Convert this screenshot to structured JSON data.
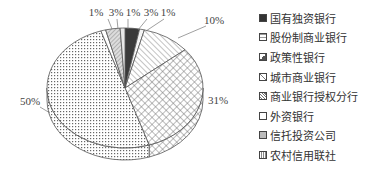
{
  "chart_data": {
    "type": "pie",
    "style": "3d-pie with hatch patterns",
    "title": "",
    "categories": [
      "国有独资银行",
      "股份制商业银行",
      "政策性银行",
      "城市商业银行",
      "商业银行授权分行",
      "外资银行",
      "信托投资公司",
      "农村信用联社"
    ],
    "values": [
      3,
      1,
      10,
      31,
      50,
      1,
      3,
      1
    ],
    "value_labels": [
      "3%",
      "1%",
      "10%",
      "31%",
      "50%",
      "1%",
      "3%",
      "1%"
    ],
    "legend_position": "right",
    "start_angle": "12 o'clock, clockwise"
  },
  "legend": {
    "items": [
      {
        "label": "国有独资银行",
        "pattern": "solid-dark"
      },
      {
        "label": "股份制商业银行",
        "pattern": "sparse"
      },
      {
        "label": "政策性银行",
        "pattern": "diagonal"
      },
      {
        "label": "城市商业银行",
        "pattern": "crosshatch"
      },
      {
        "label": "商业银行授权分行",
        "pattern": "dots"
      },
      {
        "label": "外资银行",
        "pattern": "white"
      },
      {
        "label": "信托投资公司",
        "pattern": "light-grey"
      },
      {
        "label": "农村信用联社",
        "pattern": "check"
      }
    ]
  },
  "labels": {
    "top": [
      "1%",
      "3%",
      "1%",
      "3%",
      "1%"
    ],
    "ten": "10%",
    "thirtyone": "31%",
    "fifty": "50%"
  }
}
